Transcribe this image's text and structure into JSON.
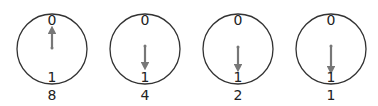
{
  "diagram": {
    "colors": {
      "circle": "#333333",
      "arrow": "#777777",
      "text": "#222222"
    },
    "dials": [
      {
        "top_label": "0",
        "bottom_label": "1",
        "caption": "8",
        "arrow_direction": "up",
        "arrow_from": 34,
        "arrow_to": 12
      },
      {
        "top_label": "0",
        "bottom_label": "1",
        "caption": "4",
        "arrow_direction": "down",
        "arrow_from": -4,
        "arrow_to": 19
      },
      {
        "top_label": "0",
        "bottom_label": "1",
        "caption": "2",
        "arrow_direction": "down",
        "arrow_from": -2,
        "arrow_to": 21
      },
      {
        "top_label": "0",
        "bottom_label": "1",
        "caption": "1",
        "arrow_direction": "down",
        "arrow_from": -3,
        "arrow_to": 23
      }
    ]
  }
}
